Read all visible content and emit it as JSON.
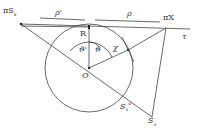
{
  "labels": {
    "pi_sx": "πS",
    "pi_sx_sub": "x",
    "rho_prime": "ρ'",
    "rho": "ρ",
    "pi_x": "πX",
    "tau": "τ",
    "R": "R",
    "theta_prime": "ϑ'",
    "theta": "ϑ",
    "chi": "χ",
    "O": "O",
    "sx0": "S",
    "sx0_sub": "x",
    "sx0_sup": "o",
    "sx": "S",
    "sx_sub": "x"
  }
}
